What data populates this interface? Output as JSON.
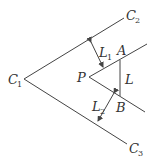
{
  "diagram": {
    "labels": {
      "C1": {
        "main": "C",
        "sub": "1"
      },
      "C2": {
        "main": "C",
        "sub": "2"
      },
      "C3": {
        "main": "C",
        "sub": "3"
      },
      "L1": {
        "main": "L",
        "sub": "1"
      },
      "L2": {
        "main": "L",
        "sub": "2"
      },
      "P": {
        "main": "P"
      },
      "A": {
        "main": "A"
      },
      "B": {
        "main": "B"
      },
      "L": {
        "main": "L"
      }
    },
    "colors": {
      "line": "#444444",
      "text": "#333333",
      "background": "#ffffff"
    }
  }
}
